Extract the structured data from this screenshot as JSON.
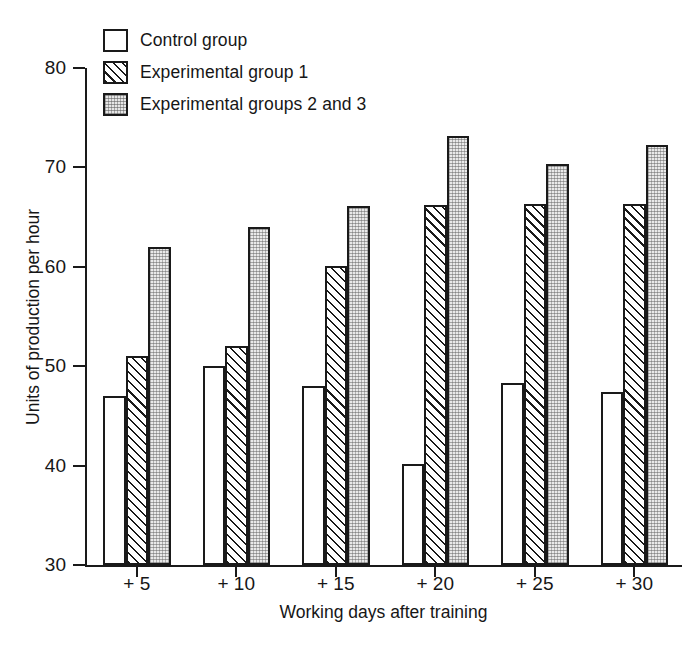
{
  "chart_data": {
    "type": "bar",
    "title": "",
    "xlabel": "Working days after training",
    "ylabel": "Units of production per hour",
    "categories": [
      "+ 5",
      "+ 10",
      "+ 15",
      "+ 20",
      "+ 25",
      "+ 30"
    ],
    "series": [
      {
        "name": "Control group",
        "values": [
          47.0,
          50.0,
          48.0,
          40.2,
          48.3,
          47.4
        ]
      },
      {
        "name": "Experimental group 1",
        "values": [
          51.0,
          52.0,
          60.1,
          66.2,
          66.3,
          66.3
        ]
      },
      {
        "name": "Experimental groups 2 and 3",
        "values": [
          62.0,
          64.0,
          66.1,
          73.2,
          70.3,
          72.3
        ]
      }
    ],
    "ylim": [
      30,
      80
    ],
    "yticks": [
      30,
      40,
      50,
      60,
      70,
      80
    ],
    "ytick_labels": [
      "30",
      "40",
      "50",
      "60",
      "70",
      "80"
    ],
    "grid": false,
    "legend_position": "top-left"
  },
  "legend": {
    "items": [
      {
        "label": "Control group",
        "swatch": "empty-white-square"
      },
      {
        "label": "Experimental group 1",
        "swatch": "diagonal-hatch-square"
      },
      {
        "label": "Experimental groups 2 and 3",
        "swatch": "gray-stipple-square"
      }
    ]
  },
  "colors": {
    "axis": "#1a1a1a",
    "outline": "#1a1a1a",
    "control_fill": "#ffffff",
    "exp1_fill": "#ffffff",
    "exp23_fill": "#e9e9e9",
    "background": "#ffffff"
  }
}
